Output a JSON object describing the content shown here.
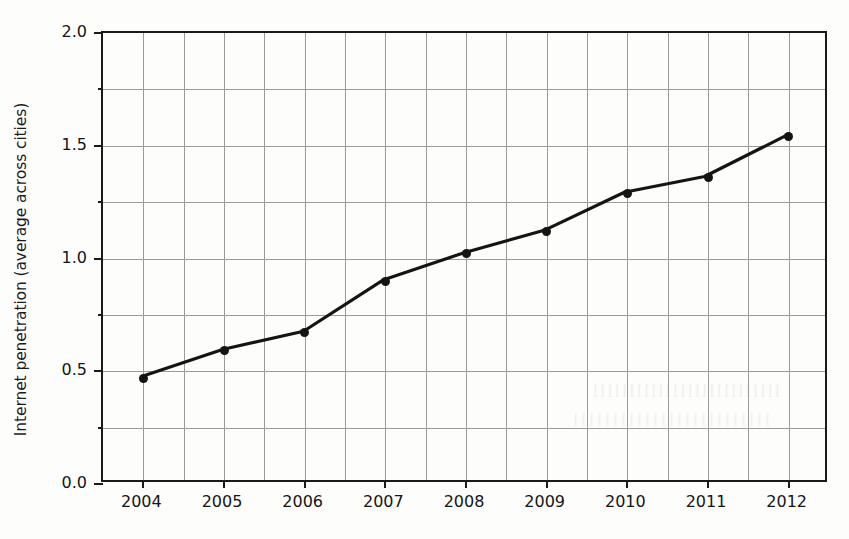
{
  "chart_data": {
    "type": "line",
    "title": "",
    "subtitle": "",
    "xlabel": "",
    "ylabel": "Internet penetration (average across cities)",
    "categories": [
      "2004",
      "2005",
      "2006",
      "2007",
      "2008",
      "2009",
      "2010",
      "2011",
      "2012"
    ],
    "x": [
      2004,
      2005,
      2006,
      2007,
      2008,
      2009,
      2010,
      2011,
      2012
    ],
    "values": [
      0.47,
      0.59,
      0.67,
      0.9,
      1.02,
      1.12,
      1.29,
      1.36,
      1.54
    ],
    "series": [
      {
        "name": "Internet penetration (average across cities)",
        "values": [
          0.47,
          0.59,
          0.67,
          0.9,
          1.02,
          1.12,
          1.29,
          1.36,
          1.54
        ],
        "color": "#141414",
        "marker": "circle",
        "line_style": "solid"
      }
    ],
    "ylim": [
      0.0,
      2.0
    ],
    "yticks": [
      0.0,
      0.5,
      1.0,
      1.5,
      2.0
    ],
    "ytick_labels": [
      "0.0",
      "0.5",
      "1.0",
      "1.5",
      "2.0"
    ],
    "yminor_ticks": [
      0.25,
      0.75,
      1.25,
      1.75
    ],
    "xlim": [
      2003.5,
      2012.5
    ],
    "xticks": [
      2004,
      2005,
      2006,
      2007,
      2008,
      2009,
      2010,
      2011,
      2012
    ],
    "grid": true,
    "grid_color": "#9b9b9b",
    "grid_y_interval": 0.25,
    "grid_x_interval": 0.5,
    "legend": false,
    "legend_position": "none",
    "annotations": [],
    "axis_color": "#1a1a1a",
    "background": "#fdfdfc"
  },
  "axis": {
    "y_title": "Internet penetration (average across cities)",
    "y_tick_labels": [
      "0.0",
      "0.5",
      "1.0",
      "1.5",
      "2.0"
    ],
    "x_tick_labels": [
      "2004",
      "2005",
      "2006",
      "2007",
      "2008",
      "2009",
      "2010",
      "2011",
      "2012"
    ]
  },
  "artifacts": {
    "bleed_text_1": "llllllllllllllllllllllllll",
    "bleed_text_2": "lllllllllllllllllllllllll"
  }
}
